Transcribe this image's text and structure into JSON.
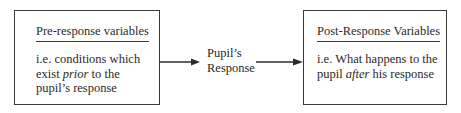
{
  "diagram": {
    "pre_box": {
      "title": "Pre-response variables",
      "line1": "i.e. conditions which",
      "line2_pre": "exist ",
      "line2_em": "prior",
      "line2_post": " to the",
      "line3": "pupil’s response"
    },
    "center": {
      "line1": "Pupil’s",
      "line2": "Response"
    },
    "post_box": {
      "title": "Post-Response Variables",
      "line1": "i.e. What happens to the",
      "line2_pre": "pupil ",
      "line2_em": "after",
      "line2_post": " his response"
    },
    "arrows": [
      {
        "from": "pre_box",
        "to": "center"
      },
      {
        "from": "center",
        "to": "post_box"
      }
    ]
  }
}
